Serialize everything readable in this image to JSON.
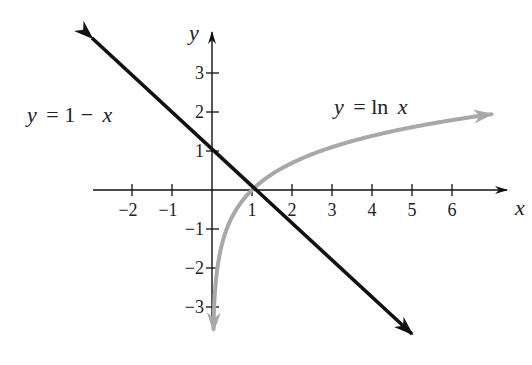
{
  "chart_data": {
    "type": "line",
    "title": "",
    "xlabel": "x",
    "ylabel": "y",
    "xlim": [
      -2.9,
      7.4
    ],
    "ylim": [
      -3.6,
      4.0
    ],
    "grid": false,
    "x_ticks": [
      -2,
      -1,
      1,
      2,
      3,
      4,
      5,
      6
    ],
    "y_ticks": [
      -3,
      -2,
      -1,
      1,
      2,
      3
    ],
    "x_tick_labels": [
      "−2",
      "−1",
      "1",
      "2",
      "3",
      "4",
      "5",
      "6"
    ],
    "y_tick_labels": [
      "−3",
      "−2",
      "−1",
      "1",
      "2",
      "3"
    ],
    "series": [
      {
        "name": "y = 1 − x",
        "color": "#111111",
        "kind": "line",
        "x": [
          -3.0,
          5.0
        ],
        "y": [
          4.0,
          -4.0
        ],
        "arrows": "both"
      },
      {
        "name": "y = ln x",
        "color": "#a8a8a8",
        "kind": "curve",
        "x": [
          0.02,
          0.05,
          0.1,
          0.2,
          0.3,
          0.5,
          0.75,
          1,
          1.5,
          2,
          3,
          4,
          5,
          6,
          7
        ],
        "y": [
          -3.6,
          -3.0,
          -2.3,
          -1.61,
          -1.2,
          -0.69,
          -0.29,
          0,
          0.41,
          0.69,
          1.1,
          1.39,
          1.61,
          1.79,
          1.95
        ],
        "arrows": "both"
      }
    ],
    "annotations": [
      {
        "text": "y = 1 − x",
        "x": -2.6,
        "y": 1.45
      },
      {
        "text": "y = ln x",
        "x": 3.5,
        "y": 2.2
      }
    ],
    "intersection": {
      "x": 1,
      "y": 0
    }
  },
  "labels": {
    "x_axis": "x",
    "y_axis": "y",
    "line_label_y": "y",
    "line_label_eq": "= 1 −",
    "line_label_x": "x",
    "ln_label_y": "y",
    "ln_label_eq": "= ln",
    "ln_label_x": "x"
  }
}
